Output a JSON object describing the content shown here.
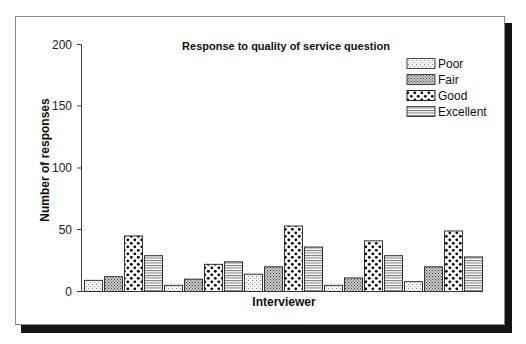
{
  "chart_data": {
    "type": "bar",
    "title": "Response to quality of service question",
    "xlabel": "Interviewer",
    "ylabel": "Number of responses",
    "ylim": [
      0,
      200
    ],
    "yticks": [
      0,
      50,
      100,
      150,
      200
    ],
    "grid": false,
    "legend_position": "top-right",
    "categories": [
      "1",
      "2",
      "3",
      "4",
      "5"
    ],
    "category_labels_visible": false,
    "series": [
      {
        "name": "Poor",
        "pattern": "stipple",
        "values": [
          9,
          5,
          14,
          5,
          8
        ]
      },
      {
        "name": "Fair",
        "pattern": "crosshatch",
        "values": [
          12,
          10,
          20,
          11,
          20
        ]
      },
      {
        "name": "Good",
        "pattern": "dots",
        "values": [
          45,
          22,
          53,
          41,
          49
        ]
      },
      {
        "name": "Excellent",
        "pattern": "wavy-lines",
        "values": [
          29,
          24,
          36,
          29,
          28
        ]
      }
    ]
  },
  "colors": {
    "bar_outline": "#333333",
    "shadow": "#141414",
    "frame_border": "#8a8a8a"
  }
}
